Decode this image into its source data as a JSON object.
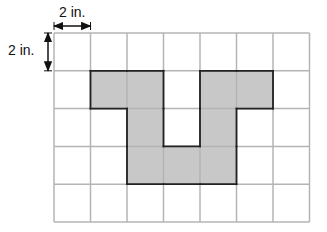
{
  "grid": {
    "cols": 7,
    "rows": 5,
    "left": 54,
    "top": 33,
    "cell_w": 36.5,
    "cell_h": 37.8,
    "line_color": "#b4b4b4",
    "shade_color": "#c8c8c8",
    "outline_color": "#222222",
    "shaded_cells": [
      [
        1,
        1
      ],
      [
        1,
        2
      ],
      [
        1,
        4
      ],
      [
        1,
        5
      ],
      [
        2,
        2
      ],
      [
        2,
        4
      ],
      [
        3,
        2
      ],
      [
        3,
        3
      ],
      [
        3,
        4
      ]
    ]
  },
  "dimensions": {
    "horizontal_label": "2 in.",
    "vertical_label": "2 in."
  }
}
